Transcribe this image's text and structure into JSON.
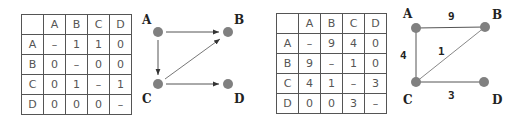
{
  "colors": {
    "node_fill": "#808080",
    "edge": "#555555",
    "table_border": "#555555",
    "text": "#555555",
    "label": "#222222"
  },
  "directed": {
    "table": {
      "headers": [
        "",
        "A",
        "B",
        "C",
        "D"
      ],
      "rows": [
        [
          "A",
          "–",
          "1",
          "1",
          "0"
        ],
        [
          "B",
          "0",
          "–",
          "0",
          "0"
        ],
        [
          "C",
          "0",
          "1",
          "–",
          "1"
        ],
        [
          "D",
          "0",
          "0",
          "0",
          "–"
        ]
      ]
    },
    "graph": {
      "nodes": [
        {
          "id": "A",
          "label": "A"
        },
        {
          "id": "B",
          "label": "B"
        },
        {
          "id": "C",
          "label": "C"
        },
        {
          "id": "D",
          "label": "D"
        }
      ],
      "edges": [
        {
          "from": "A",
          "to": "B"
        },
        {
          "from": "A",
          "to": "C"
        },
        {
          "from": "C",
          "to": "B"
        },
        {
          "from": "C",
          "to": "D"
        }
      ]
    }
  },
  "weighted": {
    "table": {
      "headers": [
        "",
        "A",
        "B",
        "C",
        "D"
      ],
      "rows": [
        [
          "A",
          "–",
          "9",
          "4",
          "0"
        ],
        [
          "B",
          "9",
          "–",
          "1",
          "0"
        ],
        [
          "C",
          "4",
          "1",
          "–",
          "3"
        ],
        [
          "D",
          "0",
          "0",
          "3",
          "–"
        ]
      ]
    },
    "graph": {
      "nodes": [
        {
          "id": "A",
          "label": "A"
        },
        {
          "id": "B",
          "label": "B"
        },
        {
          "id": "C",
          "label": "C"
        },
        {
          "id": "D",
          "label": "D"
        }
      ],
      "edges": [
        {
          "from": "A",
          "to": "B",
          "weight": "9"
        },
        {
          "from": "A",
          "to": "C",
          "weight": "4"
        },
        {
          "from": "C",
          "to": "B",
          "weight": "1"
        },
        {
          "from": "C",
          "to": "D",
          "weight": "3"
        }
      ]
    }
  }
}
